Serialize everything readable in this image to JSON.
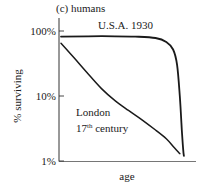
{
  "chart_data": {
    "type": "line",
    "title": "(c) humans",
    "xlabel": "age",
    "ylabel": "% surviving",
    "yscale": "log",
    "ylim": [
      1,
      100
    ],
    "xlim": [
      0,
      1
    ],
    "y_ticks": [
      {
        "value": 100,
        "label": "100%"
      },
      {
        "value": 10,
        "label": "10%"
      },
      {
        "value": 1,
        "label": "1%"
      }
    ],
    "x_ticks": [],
    "grid": false,
    "series": [
      {
        "name": "U.S.A. 1930",
        "label_lines": [
          "U.S.A. 1930"
        ],
        "x": [
          0.0,
          0.2,
          0.4,
          0.55,
          0.7,
          0.78,
          0.83,
          0.86,
          0.88,
          0.895,
          0.905,
          0.91
        ],
        "y": [
          82,
          83,
          83,
          82,
          78,
          68,
          52,
          30,
          10,
          3,
          1.5,
          1.2
        ]
      },
      {
        "name": "London 17th century",
        "label_lines": [
          "London",
          "17th century"
        ],
        "x": [
          0.0,
          0.1,
          0.2,
          0.3,
          0.4,
          0.5,
          0.6,
          0.7,
          0.78,
          0.84,
          0.88
        ],
        "y": [
          65,
          38,
          22,
          13,
          8.5,
          6,
          4.3,
          3,
          2.2,
          1.6,
          1.3
        ]
      }
    ],
    "color": "#1a1a1a"
  }
}
